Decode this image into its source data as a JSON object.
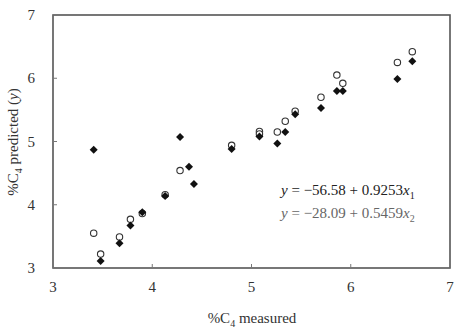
{
  "chart_data": {
    "type": "scatter",
    "title": "",
    "xlabel": "%C4 measured",
    "ylabel": "%C4 predicted (y)",
    "xlim": [
      3,
      7
    ],
    "ylim": [
      3,
      7
    ],
    "x_ticks": [
      "3",
      "4",
      "5",
      "6",
      "7"
    ],
    "y_ticks": [
      "3",
      "4",
      "5",
      "6",
      "7"
    ],
    "grid": false,
    "legend": null,
    "series": [
      {
        "name": "x1 (filled diamond)",
        "marker": "diamond-filled",
        "color": "#111111",
        "points": [
          [
            3.41,
            4.87
          ],
          [
            3.48,
            3.11
          ],
          [
            3.67,
            3.39
          ],
          [
            3.78,
            3.67
          ],
          [
            3.9,
            3.88
          ],
          [
            4.13,
            4.14
          ],
          [
            4.28,
            5.07
          ],
          [
            4.37,
            4.6
          ],
          [
            4.42,
            4.33
          ],
          [
            4.8,
            4.88
          ],
          [
            5.08,
            5.08
          ],
          [
            5.26,
            4.97
          ],
          [
            5.34,
            5.15
          ],
          [
            5.44,
            5.43
          ],
          [
            5.7,
            5.53
          ],
          [
            5.86,
            5.8
          ],
          [
            5.92,
            5.8
          ],
          [
            6.47,
            5.99
          ],
          [
            6.62,
            6.27
          ]
        ]
      },
      {
        "name": "x2 (open circle)",
        "marker": "circle-open",
        "color": "#333333",
        "points": [
          [
            3.41,
            3.55
          ],
          [
            3.48,
            3.22
          ],
          [
            3.67,
            3.49
          ],
          [
            3.78,
            3.77
          ],
          [
            3.9,
            3.86
          ],
          [
            4.13,
            4.16
          ],
          [
            4.28,
            4.54
          ],
          [
            4.8,
            4.94
          ],
          [
            5.08,
            5.16
          ],
          [
            5.08,
            5.12
          ],
          [
            5.26,
            5.15
          ],
          [
            5.34,
            5.32
          ],
          [
            5.44,
            5.48
          ],
          [
            5.7,
            5.7
          ],
          [
            5.86,
            6.05
          ],
          [
            5.92,
            5.92
          ],
          [
            6.47,
            6.25
          ],
          [
            6.62,
            6.42
          ]
        ]
      }
    ],
    "annotations": [
      {
        "text": "y = −56.58 + 0.9253x₁",
        "lhs": "y",
        "rhs": " = −56.58 + 0.9253",
        "var": "x",
        "sub": "1",
        "color": "#222222"
      },
      {
        "text": "y = −28.09 + 0.5459x₂",
        "lhs": "y",
        "rhs": " = −28.09 + 0.5459",
        "var": "x",
        "sub": "2",
        "color": "#666666"
      }
    ]
  },
  "axis_labels": {
    "x_prefix": "%C",
    "x_sub": "4",
    "x_suffix": " measured",
    "y_prefix": "%C",
    "y_sub": "4",
    "y_suffix": " predicted (",
    "y_var": "y",
    "y_close": ")"
  }
}
